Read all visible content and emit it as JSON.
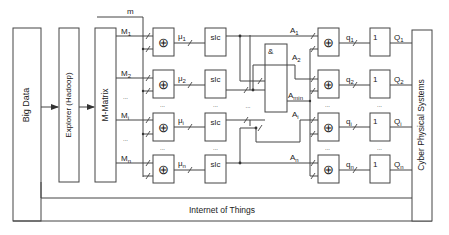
{
  "diagram": {
    "boxes": {
      "big_data": "Big Data",
      "explorer": "Explorer (Hadoop)",
      "m_matrix": "M-Matrix",
      "cps": "Cyber Physical Systems",
      "and_gate": "&",
      "xor_symbol": "⊕",
      "slc": "slc",
      "one": "1"
    },
    "signals": {
      "m": "m",
      "M": [
        "M",
        "M",
        "M",
        "M"
      ],
      "M_sub": [
        "1",
        "2",
        "i",
        "n"
      ],
      "mu": [
        "μ",
        "μ",
        "μ",
        "μ"
      ],
      "mu_sub": [
        "1",
        "2",
        "i",
        "n"
      ],
      "A": [
        "A",
        "A",
        "A",
        "A"
      ],
      "A_sub": [
        "1",
        "2",
        "i",
        "n"
      ],
      "A_min": "A",
      "A_min_sub": "min",
      "q": [
        "q",
        "q",
        "q",
        "q"
      ],
      "q_sub": [
        "1",
        "2",
        "i",
        "n"
      ],
      "Q": [
        "Q",
        "Q",
        "Q",
        "Q"
      ],
      "Q_sub": [
        "1",
        "2",
        "i",
        "n"
      ],
      "ellipsis": "..."
    },
    "bottom_label": "Internet of Things"
  }
}
